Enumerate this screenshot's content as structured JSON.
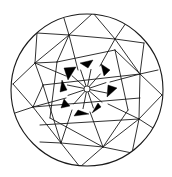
{
  "diagram": {
    "type": "circular-tiling",
    "colors": {
      "line": "#1a1a1a",
      "fill": "#000000",
      "background": "#ffffff"
    },
    "outer_circle": {
      "cx": 87,
      "cy": 90,
      "r": 76
    },
    "hub": {
      "cx": 87,
      "cy": 89,
      "r": 3
    },
    "outer_edges": [
      [
        37,
        33,
        69,
        35
      ],
      [
        63,
        15,
        69,
        35
      ],
      [
        69,
        35,
        93,
        13
      ],
      [
        69,
        35,
        115,
        39
      ],
      [
        93,
        13,
        115,
        39
      ],
      [
        115,
        39,
        126,
        23
      ],
      [
        115,
        39,
        144,
        43
      ],
      [
        144,
        43,
        140,
        74
      ],
      [
        115,
        39,
        140,
        74
      ],
      [
        140,
        74,
        158,
        70
      ],
      [
        140,
        74,
        162,
        95
      ],
      [
        140,
        74,
        139,
        119
      ],
      [
        162,
        95,
        139,
        119
      ],
      [
        139,
        119,
        153,
        128
      ],
      [
        139,
        119,
        132,
        153
      ],
      [
        132,
        153,
        103,
        147
      ],
      [
        139,
        119,
        103,
        147
      ],
      [
        103,
        147,
        80,
        167
      ],
      [
        103,
        147,
        61,
        143
      ],
      [
        61,
        143,
        80,
        167
      ],
      [
        61,
        143,
        40,
        142
      ],
      [
        61,
        143,
        33,
        107
      ],
      [
        33,
        107,
        15,
        113
      ],
      [
        33,
        107,
        13,
        84
      ],
      [
        13,
        84,
        35,
        63
      ],
      [
        35,
        63,
        37,
        33
      ],
      [
        35,
        63,
        69,
        35
      ],
      [
        35,
        63,
        57,
        62
      ],
      [
        57,
        62,
        69,
        35
      ],
      [
        33,
        107,
        43,
        85
      ],
      [
        43,
        85,
        35,
        63
      ]
    ],
    "ring_edges": [
      [
        57,
        62,
        115,
        50
      ],
      [
        115,
        50,
        140,
        74
      ],
      [
        43,
        85,
        140,
        74
      ],
      [
        33,
        107,
        140,
        98
      ],
      [
        40,
        125,
        139,
        119
      ],
      [
        43,
        85,
        61,
        143
      ],
      [
        57,
        62,
        50,
        118
      ],
      [
        115,
        50,
        128,
        110
      ],
      [
        50,
        118,
        103,
        147
      ],
      [
        128,
        110,
        103,
        147
      ],
      [
        69,
        35,
        78,
        70
      ],
      [
        115,
        39,
        100,
        66
      ],
      [
        140,
        74,
        110,
        82
      ],
      [
        139,
        119,
        108,
        104
      ],
      [
        103,
        147,
        90,
        112
      ],
      [
        61,
        143,
        72,
        110
      ],
      [
        33,
        107,
        66,
        98
      ],
      [
        35,
        63,
        66,
        76
      ]
    ],
    "spokes_count": 12,
    "spoke_inner_r": 3,
    "spoke_outer_r": 20,
    "black_triangles": [
      [
        [
          64,
          68
        ],
        [
          76,
          67
        ],
        [
          68,
          80
        ]
      ],
      [
        [
          80,
          63
        ],
        [
          93,
          60
        ],
        [
          88,
          68
        ]
      ],
      [
        [
          101,
          64
        ],
        [
          110,
          70
        ],
        [
          104,
          76
        ]
      ],
      [
        [
          108,
          85
        ],
        [
          117,
          88
        ],
        [
          107,
          97
        ]
      ],
      [
        [
          101,
          107
        ],
        [
          92,
          113
        ],
        [
          98,
          103
        ]
      ],
      [
        [
          78,
          110
        ],
        [
          89,
          114
        ],
        [
          74,
          116
        ]
      ],
      [
        [
          64,
          99
        ],
        [
          70,
          106
        ],
        [
          61,
          108
        ]
      ],
      [
        [
          62,
          80
        ],
        [
          67,
          90
        ],
        [
          60,
          92
        ]
      ]
    ]
  }
}
